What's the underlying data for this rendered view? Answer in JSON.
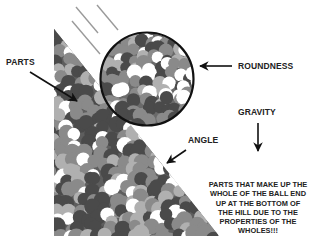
{
  "diagram": {
    "title": "",
    "labels": {
      "parts": "PARTS",
      "roundness": "ROUNDNESS",
      "gravity": "GRAVITY",
      "angle": "ANGLE"
    },
    "explanation_lines": [
      "PARTS THAT MAKE UP THE",
      "WHOLE OF THE BALL END",
      "UP AT THE BOTTOM OF",
      "THE HILL DUE TO THE",
      "PROPERTIES OF THE",
      "WHOLES!!!"
    ],
    "elements": {
      "hill": "triangle-slope filled with mottled circles",
      "ball": "circle outlined in black filled with mottled circles",
      "motion_lines": 3
    },
    "colors": {
      "background": "#ffffff",
      "dark_part": "#4a4a4a",
      "mid_part": "#8a8a8a",
      "light_part": "#b0b0b0",
      "white_part": "#ffffff",
      "outline": "#111111",
      "text": "#222222",
      "motion_line": "#9a9a9a"
    }
  }
}
